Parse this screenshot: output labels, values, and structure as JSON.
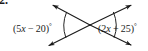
{
  "figure": {
    "kind": "geometry-diagram",
    "problem_number": "2.",
    "background_color": "#ffffff",
    "stroke_color": "#1a1a1a",
    "text_color": "#1a1a1a"
  },
  "labels": {
    "left_angle": {
      "full_text": "(5x − 20)°",
      "open_paren": "(",
      "coefficient": "5",
      "variable": "x",
      "operator": " − ",
      "constant": "20",
      "close_paren": ")",
      "degree": "°"
    },
    "right_angle": {
      "full_text": "(2x + 25)°",
      "open_paren": "(",
      "coefficient": "2",
      "variable": "x",
      "operator": " + ",
      "constant": "25",
      "close_paren": ")",
      "degree": "°"
    }
  },
  "geometry": {
    "intersection": {
      "x": 90,
      "y": 25
    },
    "rays": [
      {
        "name": "ray-upper-left",
        "tip_x": 51,
        "tip_y": 4,
        "arrowhead": true
      },
      {
        "name": "ray-upper-right",
        "tip_x": 133,
        "tip_y": 4,
        "arrowhead": true
      },
      {
        "name": "ray-lower-left",
        "tip_x": 47,
        "tip_y": 47,
        "arrowhead": true
      },
      {
        "name": "ray-lower-right",
        "tip_x": 133,
        "tip_y": 46,
        "arrowhead": true
      }
    ],
    "arcs": [
      {
        "name": "arc-left-angle",
        "side": "left"
      },
      {
        "name": "arc-right-angle",
        "side": "right"
      }
    ]
  }
}
